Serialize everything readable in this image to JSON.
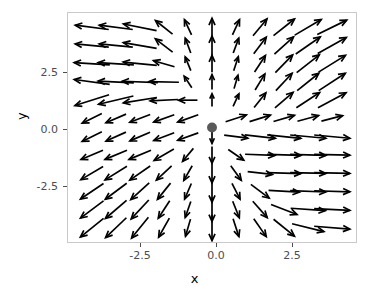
{
  "chart_data": {
    "type": "quiver",
    "title": "",
    "xlabel": "x",
    "ylabel": "y",
    "xlim": [
      -4.8,
      4.8
    ],
    "ylim": [
      -4.4,
      4.4
    ],
    "xticks": [
      -2.5,
      0.0,
      2.5
    ],
    "xticklabels": [
      "-2.5",
      "0.0",
      "2.5"
    ],
    "yticks": [
      -2.5,
      0.0,
      2.5
    ],
    "yticklabels": [
      "-2.5",
      "0.0",
      "2.5"
    ],
    "grid": false,
    "legend": null,
    "arrow_color": "#000000",
    "panel_border_color": "#c9c9c9",
    "panel_background": "#ffffff",
    "fixed_points": [
      {
        "x": 0.0,
        "y": 0.0,
        "color": "#595959",
        "radius_px": 5,
        "label": ""
      }
    ],
    "grid_nx": 11,
    "grid_ny": 12,
    "grid_x": [
      -4.0,
      -3.2,
      -2.4,
      -1.6,
      -0.8,
      0.0,
      0.8,
      1.6,
      2.4,
      3.2,
      4.0
    ],
    "grid_y": [
      3.85,
      3.15,
      2.45,
      1.75,
      1.05,
      0.35,
      -0.35,
      -1.05,
      -1.75,
      -2.45,
      -3.15,
      -3.85
    ],
    "arrows": [
      {
        "x": -4.0,
        "y": 3.85,
        "u": -1.0,
        "v": 0.13
      },
      {
        "x": -3.2,
        "y": 3.85,
        "u": -1.0,
        "v": 0.13
      },
      {
        "x": -2.4,
        "y": 3.85,
        "u": -1.0,
        "v": 0.2
      },
      {
        "x": -1.6,
        "y": 3.85,
        "u": -0.78,
        "v": 0.62
      },
      {
        "x": -0.8,
        "y": 3.85,
        "u": -0.42,
        "v": 0.91
      },
      {
        "x": 0.0,
        "y": 3.85,
        "u": 0.0,
        "v": 1.0
      },
      {
        "x": 0.8,
        "y": 3.85,
        "u": 0.42,
        "v": 0.91
      },
      {
        "x": 1.6,
        "y": 3.85,
        "u": 0.64,
        "v": 0.77
      },
      {
        "x": 2.4,
        "y": 3.85,
        "u": 0.78,
        "v": 0.62
      },
      {
        "x": 3.2,
        "y": 3.85,
        "u": 0.86,
        "v": 0.51
      },
      {
        "x": 4.0,
        "y": 3.85,
        "u": 0.9,
        "v": 0.44
      },
      {
        "x": -4.0,
        "y": 3.15,
        "u": -1.0,
        "v": 0.1
      },
      {
        "x": -3.2,
        "y": 3.15,
        "u": -1.0,
        "v": 0.1
      },
      {
        "x": -2.4,
        "y": 3.15,
        "u": -1.0,
        "v": 0.17
      },
      {
        "x": -1.6,
        "y": 3.15,
        "u": -0.79,
        "v": 0.61
      },
      {
        "x": -0.8,
        "y": 3.15,
        "u": -0.35,
        "v": 0.94
      },
      {
        "x": 0.0,
        "y": 3.15,
        "u": 0.0,
        "v": 1.0
      },
      {
        "x": 0.8,
        "y": 3.15,
        "u": 0.35,
        "v": 0.94
      },
      {
        "x": 1.6,
        "y": 3.15,
        "u": 0.6,
        "v": 0.8
      },
      {
        "x": 2.4,
        "y": 3.15,
        "u": 0.74,
        "v": 0.67
      },
      {
        "x": 3.2,
        "y": 3.15,
        "u": 0.82,
        "v": 0.57
      },
      {
        "x": 4.0,
        "y": 3.15,
        "u": 0.87,
        "v": 0.49
      },
      {
        "x": -4.0,
        "y": 2.45,
        "u": -1.0,
        "v": 0.06
      },
      {
        "x": -3.2,
        "y": 2.45,
        "u": -1.0,
        "v": 0.06
      },
      {
        "x": -2.4,
        "y": 2.45,
        "u": -1.0,
        "v": 0.1
      },
      {
        "x": -1.6,
        "y": 2.45,
        "u": -0.96,
        "v": 0.28
      },
      {
        "x": -0.8,
        "y": 2.45,
        "u": -0.38,
        "v": 0.93
      },
      {
        "x": 0.0,
        "y": 2.45,
        "u": 0.0,
        "v": 1.0
      },
      {
        "x": 0.8,
        "y": 2.45,
        "u": 0.31,
        "v": 0.95
      },
      {
        "x": 1.6,
        "y": 2.45,
        "u": 0.55,
        "v": 0.84
      },
      {
        "x": 2.4,
        "y": 2.45,
        "u": 0.7,
        "v": 0.72
      },
      {
        "x": 3.2,
        "y": 2.45,
        "u": 0.79,
        "v": 0.62
      },
      {
        "x": 4.0,
        "y": 2.45,
        "u": 0.85,
        "v": 0.53
      },
      {
        "x": -4.0,
        "y": 1.75,
        "u": -0.99,
        "v": 0.14
      },
      {
        "x": -3.2,
        "y": 1.75,
        "u": -1.0,
        "v": 0.05
      },
      {
        "x": -2.4,
        "y": 1.75,
        "u": -1.0,
        "v": 0.04
      },
      {
        "x": -1.6,
        "y": 1.75,
        "u": -1.0,
        "v": 0.02
      },
      {
        "x": -0.8,
        "y": 1.75,
        "u": -0.55,
        "v": 0.84
      },
      {
        "x": 0.0,
        "y": 1.75,
        "u": 0.0,
        "v": 1.0
      },
      {
        "x": 0.8,
        "y": 1.75,
        "u": 0.28,
        "v": 0.96
      },
      {
        "x": 1.6,
        "y": 1.75,
        "u": 0.52,
        "v": 0.86
      },
      {
        "x": 2.4,
        "y": 1.75,
        "u": 0.68,
        "v": 0.73
      },
      {
        "x": 3.2,
        "y": 1.75,
        "u": 0.78,
        "v": 0.63
      },
      {
        "x": 4.0,
        "y": 1.75,
        "u": 0.84,
        "v": 0.55
      },
      {
        "x": -4.0,
        "y": 1.05,
        "u": -0.95,
        "v": -0.3
      },
      {
        "x": -3.2,
        "y": 1.05,
        "u": -0.97,
        "v": -0.23
      },
      {
        "x": -2.4,
        "y": 1.05,
        "u": -0.99,
        "v": -0.16
      },
      {
        "x": -1.6,
        "y": 1.05,
        "u": -1.0,
        "v": -0.05
      },
      {
        "x": -0.8,
        "y": 1.05,
        "u": -1.0,
        "v": 0.0
      },
      {
        "x": 0.0,
        "y": 1.05,
        "u": 0.0,
        "v": 1.0
      },
      {
        "x": 0.8,
        "y": 1.05,
        "u": 0.42,
        "v": 0.91
      },
      {
        "x": 1.6,
        "y": 1.05,
        "u": 0.62,
        "v": 0.78
      },
      {
        "x": 2.4,
        "y": 1.05,
        "u": 0.76,
        "v": 0.65
      },
      {
        "x": 3.2,
        "y": 1.05,
        "u": 0.84,
        "v": 0.55
      },
      {
        "x": 4.0,
        "y": 1.05,
        "u": 0.88,
        "v": 0.47
      },
      {
        "x": -4.0,
        "y": 0.35,
        "u": -0.9,
        "v": -0.44
      },
      {
        "x": -3.2,
        "y": 0.35,
        "u": -0.92,
        "v": -0.39
      },
      {
        "x": -2.4,
        "y": 0.35,
        "u": -0.93,
        "v": -0.36
      },
      {
        "x": -1.6,
        "y": 0.35,
        "u": -0.94,
        "v": -0.34
      },
      {
        "x": -0.8,
        "y": 0.35,
        "u": -0.94,
        "v": -0.34
      },
      {
        "x": 0.0,
        "y": 0.35,
        "u": 0.0,
        "v": 0.0
      },
      {
        "x": 0.8,
        "y": 0.35,
        "u": 0.95,
        "v": 0.31
      },
      {
        "x": 1.6,
        "y": 0.35,
        "u": 0.95,
        "v": 0.3
      },
      {
        "x": 2.4,
        "y": 0.35,
        "u": 0.96,
        "v": 0.28
      },
      {
        "x": 3.2,
        "y": 0.35,
        "u": 0.96,
        "v": 0.26
      },
      {
        "x": 4.0,
        "y": 0.35,
        "u": 0.97,
        "v": 0.25
      },
      {
        "x": -4.0,
        "y": -0.35,
        "u": -0.9,
        "v": -0.44
      },
      {
        "x": -3.2,
        "y": -0.35,
        "u": -0.91,
        "v": -0.41
      },
      {
        "x": -2.4,
        "y": -0.35,
        "u": -0.92,
        "v": -0.39
      },
      {
        "x": -1.6,
        "y": -0.35,
        "u": -0.93,
        "v": -0.36
      },
      {
        "x": -0.8,
        "y": -0.35,
        "u": -0.94,
        "v": -0.34
      },
      {
        "x": 0.0,
        "y": -0.35,
        "u": 0.0,
        "v": -1.0
      },
      {
        "x": 0.8,
        "y": -0.35,
        "u": 0.99,
        "v": -0.13
      },
      {
        "x": 1.6,
        "y": -0.35,
        "u": 0.99,
        "v": -0.11
      },
      {
        "x": 2.4,
        "y": -0.35,
        "u": 0.99,
        "v": -0.1
      },
      {
        "x": 3.2,
        "y": -0.35,
        "u": 0.99,
        "v": -0.09
      },
      {
        "x": 4.0,
        "y": -0.35,
        "u": 0.99,
        "v": -0.09
      },
      {
        "x": -4.0,
        "y": -1.05,
        "u": -0.92,
        "v": -0.39
      },
      {
        "x": -3.2,
        "y": -1.05,
        "u": -0.92,
        "v": -0.38
      },
      {
        "x": -2.4,
        "y": -1.05,
        "u": -0.92,
        "v": -0.38
      },
      {
        "x": -1.6,
        "y": -1.05,
        "u": -0.86,
        "v": -0.5
      },
      {
        "x": -0.8,
        "y": -1.05,
        "u": -0.64,
        "v": -0.77
      },
      {
        "x": 0.0,
        "y": -1.05,
        "u": 0.0,
        "v": -1.0
      },
      {
        "x": 0.8,
        "y": -1.05,
        "u": 0.82,
        "v": -0.57
      },
      {
        "x": 1.6,
        "y": -1.05,
        "u": 1.0,
        "v": -0.04
      },
      {
        "x": 2.4,
        "y": -1.05,
        "u": 1.0,
        "v": -0.03
      },
      {
        "x": 3.2,
        "y": -1.05,
        "u": 1.0,
        "v": -0.03
      },
      {
        "x": 4.0,
        "y": -1.05,
        "u": 1.0,
        "v": -0.02
      },
      {
        "x": -4.0,
        "y": -1.75,
        "u": -0.86,
        "v": -0.51
      },
      {
        "x": -3.2,
        "y": -1.75,
        "u": -0.85,
        "v": -0.53
      },
      {
        "x": -2.4,
        "y": -1.75,
        "u": -0.82,
        "v": -0.57
      },
      {
        "x": -1.6,
        "y": -1.75,
        "u": -0.73,
        "v": -0.68
      },
      {
        "x": -0.8,
        "y": -1.75,
        "u": -0.5,
        "v": -0.87
      },
      {
        "x": 0.0,
        "y": -1.75,
        "u": 0.0,
        "v": -1.0
      },
      {
        "x": 0.8,
        "y": -1.75,
        "u": 0.59,
        "v": -0.81
      },
      {
        "x": 1.6,
        "y": -1.75,
        "u": 0.99,
        "v": -0.11
      },
      {
        "x": 2.4,
        "y": -1.75,
        "u": 1.0,
        "v": -0.03
      },
      {
        "x": 3.2,
        "y": -1.75,
        "u": 1.0,
        "v": -0.02
      },
      {
        "x": 4.0,
        "y": -1.75,
        "u": 1.0,
        "v": -0.02
      },
      {
        "x": -4.0,
        "y": -2.45,
        "u": -0.83,
        "v": -0.56
      },
      {
        "x": -3.2,
        "y": -2.45,
        "u": -0.8,
        "v": -0.6
      },
      {
        "x": -2.4,
        "y": -2.45,
        "u": -0.74,
        "v": -0.67
      },
      {
        "x": -1.6,
        "y": -2.45,
        "u": -0.63,
        "v": -0.78
      },
      {
        "x": -0.8,
        "y": -2.45,
        "u": -0.4,
        "v": -0.92
      },
      {
        "x": 0.0,
        "y": -2.45,
        "u": 0.0,
        "v": -1.0
      },
      {
        "x": 0.8,
        "y": -2.45,
        "u": 0.45,
        "v": -0.89
      },
      {
        "x": 1.6,
        "y": -2.45,
        "u": 0.8,
        "v": -0.6
      },
      {
        "x": 2.4,
        "y": -2.45,
        "u": 1.0,
        "v": -0.06
      },
      {
        "x": 3.2,
        "y": -2.45,
        "u": 1.0,
        "v": -0.04
      },
      {
        "x": 4.0,
        "y": -2.45,
        "u": 1.0,
        "v": -0.03
      },
      {
        "x": -4.0,
        "y": -3.15,
        "u": -0.8,
        "v": -0.6
      },
      {
        "x": -3.2,
        "y": -3.15,
        "u": -0.76,
        "v": -0.65
      },
      {
        "x": -2.4,
        "y": -3.15,
        "u": -0.68,
        "v": -0.73
      },
      {
        "x": -1.6,
        "y": -3.15,
        "u": -0.55,
        "v": -0.84
      },
      {
        "x": -0.8,
        "y": -3.15,
        "u": -0.33,
        "v": -0.94
      },
      {
        "x": 0.0,
        "y": -3.15,
        "u": 0.0,
        "v": -1.0
      },
      {
        "x": 0.8,
        "y": -3.15,
        "u": 0.37,
        "v": -0.93
      },
      {
        "x": 1.6,
        "y": -3.15,
        "u": 0.66,
        "v": -0.75
      },
      {
        "x": 2.4,
        "y": -3.15,
        "u": 0.93,
        "v": -0.36
      },
      {
        "x": 3.2,
        "y": -3.15,
        "u": 1.0,
        "v": -0.07
      },
      {
        "x": 4.0,
        "y": -3.15,
        "u": 1.0,
        "v": -0.05
      },
      {
        "x": -4.0,
        "y": -3.85,
        "u": -0.78,
        "v": -0.63
      },
      {
        "x": -3.2,
        "y": -3.85,
        "u": -0.72,
        "v": -0.69
      },
      {
        "x": -2.4,
        "y": -3.85,
        "u": -0.63,
        "v": -0.78
      },
      {
        "x": -1.6,
        "y": -3.85,
        "u": -0.49,
        "v": -0.87
      },
      {
        "x": -0.8,
        "y": -3.85,
        "u": -0.28,
        "v": -0.96
      },
      {
        "x": 0.0,
        "y": -3.85,
        "u": 0.0,
        "v": -1.0
      },
      {
        "x": 0.8,
        "y": -3.85,
        "u": 0.31,
        "v": -0.95
      },
      {
        "x": 1.6,
        "y": -3.85,
        "u": 0.57,
        "v": -0.82
      },
      {
        "x": 2.4,
        "y": -3.85,
        "u": 0.78,
        "v": -0.63
      },
      {
        "x": 3.2,
        "y": -3.85,
        "u": 0.97,
        "v": -0.24
      },
      {
        "x": 4.0,
        "y": -3.85,
        "u": 1.0,
        "v": -0.08
      }
    ],
    "arrow_lengths": {
      "note": "arrow shaft length in pixels per grid node, row-major same order as arrows[]",
      "values": [
        34,
        34,
        34,
        22,
        17,
        18,
        17,
        22,
        27,
        31,
        33,
        34,
        34,
        34,
        22,
        16,
        19,
        16,
        21,
        26,
        30,
        33,
        36,
        36,
        34,
        22,
        15,
        17,
        15,
        20,
        25,
        29,
        32,
        36,
        36,
        36,
        30,
        14,
        15,
        14,
        19,
        24,
        28,
        32,
        36,
        36,
        34,
        28,
        19,
        13,
        14,
        19,
        24,
        28,
        32,
        22,
        22,
        22,
        22,
        22,
        0,
        22,
        22,
        22,
        22,
        22,
        22,
        22,
        22,
        22,
        22,
        14,
        24,
        31,
        34,
        36,
        36,
        24,
        24,
        24,
        23,
        17,
        17,
        19,
        30,
        34,
        36,
        36,
        26,
        26,
        25,
        21,
        17,
        20,
        18,
        25,
        34,
        36,
        36,
        28,
        27,
        25,
        21,
        17,
        22,
        18,
        23,
        31,
        36,
        36,
        29,
        28,
        26,
        21,
        17,
        24,
        18,
        22,
        28,
        35,
        36,
        30,
        29,
        27,
        22,
        18,
        26,
        19,
        22,
        27,
        33,
        36
      ]
    }
  },
  "axis": {
    "xlabel": "x",
    "ylabel": "y",
    "xticklabels": [
      "-2.5",
      "0.0",
      "2.5"
    ],
    "yticklabels": [
      "2.5",
      "0.0",
      "-2.5"
    ]
  }
}
